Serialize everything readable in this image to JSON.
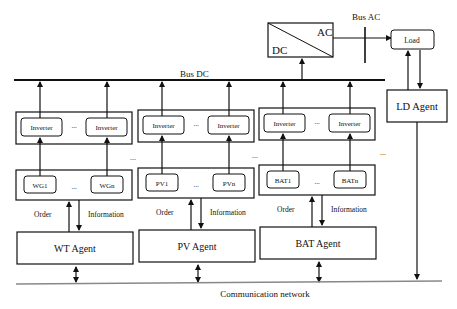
{
  "converter": {
    "ac_label": "AC",
    "dc_label": "DC"
  },
  "bus_ac": {
    "label": "Bus AC"
  },
  "bus_dc": {
    "label": "Bus DC"
  },
  "load": {
    "label": "Load"
  },
  "ld_agent": {
    "label": "LD Agent"
  },
  "groups": [
    {
      "id": "wt",
      "inverter_first": "Inverter",
      "inverter_last": "Inverter",
      "unit_first": "WG1",
      "unit_last": "WGn",
      "order_label": "Order",
      "info_label": "Information",
      "agent_label": "WT Agent"
    },
    {
      "id": "pv",
      "inverter_first": "Inverter",
      "inverter_last": "Inverter",
      "unit_first": "PV1",
      "unit_last": "PVn",
      "order_label": "Order",
      "info_label": "Information",
      "agent_label": "PV Agent"
    },
    {
      "id": "bat",
      "inverter_first": "Inverter",
      "inverter_last": "Inverter",
      "unit_first": "BAT1",
      "unit_last": "BATn",
      "order_label": "Order",
      "info_label": "Information",
      "agent_label": "BAT Agent"
    }
  ],
  "ellipsis": "...",
  "network": {
    "label": "Communication network"
  },
  "colors": {
    "line": "#111111",
    "network_line": "#888888"
  }
}
